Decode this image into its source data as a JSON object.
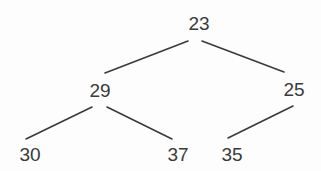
{
  "diagram": {
    "type": "binary-tree",
    "text_color": "#3a3a3a",
    "edge_color": "#3a3a3a",
    "background": "#fdfdfd",
    "nodes": [
      {
        "id": "n23",
        "label": "23",
        "x": 199,
        "y": 23
      },
      {
        "id": "n29",
        "label": "29",
        "x": 100,
        "y": 90
      },
      {
        "id": "n25",
        "label": "25",
        "x": 294,
        "y": 89
      },
      {
        "id": "n30",
        "label": "30",
        "x": 30,
        "y": 154
      },
      {
        "id": "n37",
        "label": "37",
        "x": 178,
        "y": 154
      },
      {
        "id": "n35",
        "label": "35",
        "x": 232,
        "y": 154
      }
    ],
    "edges": [
      {
        "from": "23",
        "to": "29",
        "x1": 188,
        "y1": 41,
        "x2": 105,
        "y2": 73
      },
      {
        "from": "23",
        "to": "25",
        "x1": 202,
        "y1": 41,
        "x2": 284,
        "y2": 72
      },
      {
        "from": "29",
        "to": "30",
        "x1": 92,
        "y1": 107,
        "x2": 26,
        "y2": 139
      },
      {
        "from": "29",
        "to": "37",
        "x1": 107,
        "y1": 107,
        "x2": 172,
        "y2": 139
      },
      {
        "from": "25",
        "to": "35",
        "x1": 293,
        "y1": 106,
        "x2": 228,
        "y2": 138
      }
    ]
  }
}
